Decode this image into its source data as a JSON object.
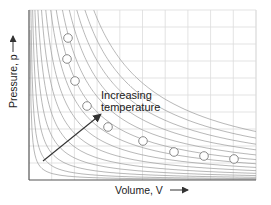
{
  "chart_data": {
    "type": "line",
    "title": "",
    "xlabel": "Volume, V",
    "ylabel": "Pressure, p",
    "grid": true,
    "axes": {
      "x_ticks": [],
      "y_ticks": []
    },
    "series": [
      {
        "name": "isotherms",
        "description": "Family of hyperbolic p-V isotherms (pV = const), increasing temperature away from origin",
        "count": 14
      },
      {
        "name": "data points",
        "marker": "open-circle",
        "points_px": [
          [
            68,
            38
          ],
          [
            67,
            59
          ],
          [
            75,
            81
          ],
          [
            87,
            106
          ],
          [
            108,
            127
          ],
          [
            143,
            141
          ],
          [
            174,
            152
          ],
          [
            204,
            156
          ],
          [
            234,
            159
          ]
        ]
      }
    ],
    "annotations": [
      {
        "text": "Increasing temperature",
        "arrow": true,
        "direction": "up-right"
      }
    ],
    "colors": {
      "axis": "#555555",
      "grid": "#dcdcdc",
      "isotherm": "#9a9a9a",
      "arrow": "#333333",
      "marker_stroke": "#8a8a8a",
      "marker_fill": "#ffffff"
    }
  },
  "labels": {
    "x_axis": "Volume, V",
    "y_axis": "Pressure, p",
    "annotation_line1": "Increasing",
    "annotation_line2": "temperature"
  }
}
